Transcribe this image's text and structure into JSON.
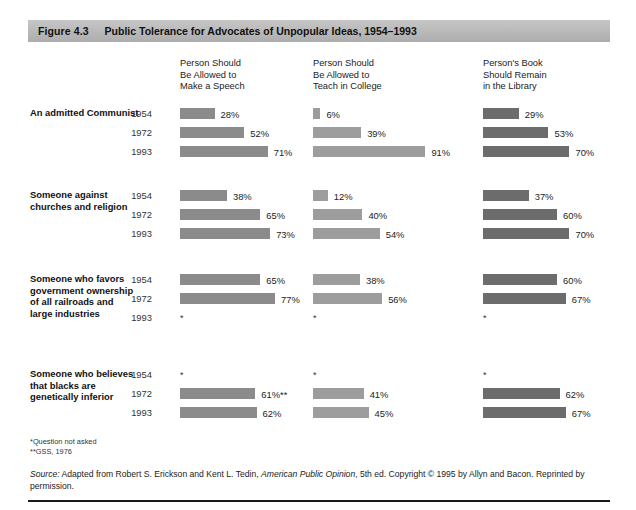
{
  "figure": {
    "number": "Figure 4.3",
    "title": "Public Tolerance for Advocates of Unpopular Ideas, 1954–1993"
  },
  "columns": [
    {
      "key": "speech",
      "header": "Person Should\nBe Allowed to\nMake a Speech",
      "color": "#8b8b8b"
    },
    {
      "key": "teach",
      "header": "Person Should\nBe Allowed to\nTeach in College",
      "color": "#9d9d9d"
    },
    {
      "key": "library",
      "header": "Person's Book\nShould Remain\nin the Library",
      "color": "#6c6c6c"
    }
  ],
  "footnotes": [
    "*Question not asked",
    "**GSS, 1976"
  ],
  "source": {
    "label": "Source:",
    "text_before_italic": " Adapted from Robert S. Erickson and Kent L. Tedin, ",
    "italic_title": "American Public Opinion",
    "text_after_italic": ", 5th ed. Copyright © 1995 by Allyn and Bacon. Reprinted by permission."
  },
  "na_symbol": "*",
  "chart_data": {
    "type": "bar",
    "title": "Public Tolerance for Advocates of Unpopular Ideas, 1954–1993",
    "xlabel": "",
    "ylabel": "",
    "xlim": [
      0,
      100
    ],
    "unit": "%",
    "grid": false,
    "legend_position": "column-headers",
    "categories": [
      "1954",
      "1972",
      "1993"
    ],
    "series": [
      {
        "name": "Person Should Be Allowed to Make a Speech"
      },
      {
        "name": "Person Should Be Allowed to Teach in College"
      },
      {
        "name": "Person's Book Should Remain in the Library"
      }
    ],
    "groups": [
      {
        "label": "An admitted Communist",
        "rows": [
          {
            "year": "1954",
            "speech": 28,
            "speech_label": "28%",
            "teach": 6,
            "teach_label": "6%",
            "library": 29,
            "library_label": "29%"
          },
          {
            "year": "1972",
            "speech": 52,
            "speech_label": "52%",
            "teach": 39,
            "teach_label": "39%",
            "library": 53,
            "library_label": "53%"
          },
          {
            "year": "1993",
            "speech": 71,
            "speech_label": "71%",
            "teach": 91,
            "teach_label": "91%",
            "library": 70,
            "library_label": "70%"
          }
        ]
      },
      {
        "label": "Someone against\nchurches and religion",
        "rows": [
          {
            "year": "1954",
            "speech": 38,
            "speech_label": "38%",
            "teach": 12,
            "teach_label": "12%",
            "library": 37,
            "library_label": "37%"
          },
          {
            "year": "1972",
            "speech": 65,
            "speech_label": "65%",
            "teach": 40,
            "teach_label": "40%",
            "library": 60,
            "library_label": "60%"
          },
          {
            "year": "1993",
            "speech": 73,
            "speech_label": "73%",
            "teach": 54,
            "teach_label": "54%",
            "library": 70,
            "library_label": "70%"
          }
        ]
      },
      {
        "label": "Someone who favors\ngovernment ownership\nof all railroads and\nlarge industries",
        "rows": [
          {
            "year": "1954",
            "speech": 65,
            "speech_label": "65%",
            "teach": 38,
            "teach_label": "38%",
            "library": 60,
            "library_label": "60%"
          },
          {
            "year": "1972",
            "speech": 77,
            "speech_label": "77%",
            "teach": 56,
            "teach_label": "56%",
            "library": 67,
            "library_label": "67%"
          },
          {
            "year": "1993",
            "speech": null,
            "speech_label": "*",
            "teach": null,
            "teach_label": "*",
            "library": null,
            "library_label": "*"
          }
        ]
      },
      {
        "label": "Someone who believes\nthat blacks are\ngenetically inferior",
        "rows": [
          {
            "year": "1954",
            "speech": null,
            "speech_label": "*",
            "teach": null,
            "teach_label": "*",
            "library": null,
            "library_label": "*"
          },
          {
            "year": "1972",
            "speech": 61,
            "speech_label": "61%**",
            "teach": 41,
            "teach_label": "41%",
            "library": 62,
            "library_label": "62%"
          },
          {
            "year": "1993",
            "speech": 62,
            "speech_label": "62%",
            "teach": 45,
            "teach_label": "45%",
            "library": 67,
            "library_label": "67%"
          }
        ]
      }
    ]
  }
}
